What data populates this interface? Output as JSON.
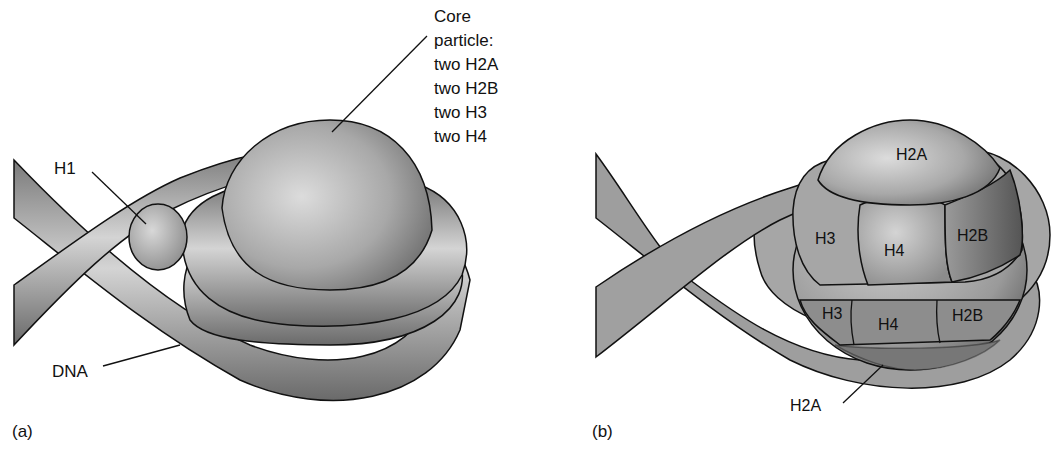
{
  "panels": {
    "a": {
      "panel_label": "(a)",
      "labels": {
        "core_title_1": "Core",
        "core_title_2": "particle:",
        "core_items": [
          "two H2A",
          "two H2B",
          "two H3",
          "two H4"
        ],
        "h1": "H1",
        "dna": "DNA"
      }
    },
    "b": {
      "panel_label": "(b)",
      "labels": {
        "top_h2a": "H2A",
        "upper_h3": "H3",
        "upper_h4": "H4",
        "upper_h2b": "H2B",
        "lower_h3": "H3",
        "lower_h4": "H4",
        "lower_h2b": "H2B",
        "bottom_h2a": "H2A"
      }
    }
  },
  "colors": {
    "background": "#ffffff",
    "dna_dark": "#6e6e6e",
    "dna_light": "#d2d2d2",
    "sphere_light": "#d8d8d8",
    "sphere_dark": "#6a6a6a",
    "outline": "#111111"
  }
}
